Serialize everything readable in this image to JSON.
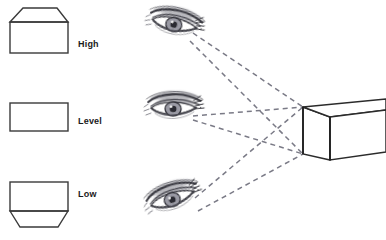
{
  "figure": {
    "background_color": "#ffffff",
    "width": 386,
    "height": 240
  },
  "labels": [
    {
      "id": "high",
      "text": "High",
      "x": 78,
      "y": 40
    },
    {
      "id": "level",
      "text": "Level",
      "x": 78,
      "y": 117
    },
    {
      "id": "low",
      "text": "Low",
      "x": 78,
      "y": 190
    }
  ],
  "left_boxes": [
    {
      "id": "box-high",
      "label": "High",
      "description": "Box seen from above: top face visible as a trapezoid above the front face",
      "stroke": "#3a3a3a",
      "front_face": {
        "x": 10,
        "y": 22,
        "width": 58,
        "height": 31
      },
      "top_face_points": "10,22 23,8 57,8 68,22"
    },
    {
      "id": "box-level",
      "label": "Level",
      "description": "Box seen at eye level: only the front face, a plain rectangle, no top or bottom visible",
      "stroke": "#3a3a3a",
      "front_face": {
        "x": 10,
        "y": 103,
        "width": 58,
        "height": 28
      },
      "top_face_points": "",
      "bottom_face_points": ""
    },
    {
      "id": "box-low",
      "label": "Low",
      "description": "Box seen from below: bottom face visible as a trapezoid below the front face",
      "stroke": "#3a3a3a",
      "front_face": {
        "x": 10,
        "y": 182,
        "width": 58,
        "height": 29
      },
      "bottom_face_points": "10,211 20,227 58,227 68,211"
    }
  ],
  "eyes": [
    {
      "id": "eye-high",
      "position": "top",
      "gaze": "downward toward the box",
      "description": "Pencil-sketched eye viewing the box from a high vantage point",
      "center_x": 175,
      "center_y": 28
    },
    {
      "id": "eye-level",
      "position": "middle",
      "gaze": "straight ahead toward the box",
      "description": "Pencil-sketched eye viewing the box at eye level",
      "center_x": 175,
      "center_y": 112
    },
    {
      "id": "eye-low",
      "position": "bottom",
      "gaze": "upward toward the box",
      "description": "Pencil-sketched eye viewing the box from a low vantage point",
      "center_x": 175,
      "center_y": 202
    }
  ],
  "perspective_box": {
    "id": "box-3d",
    "description": "Three-dimensional box drawn in two-point perspective at the right side of the diagram",
    "stroke": "#2b2b2b",
    "front_top_left": {
      "x": 303,
      "y": 107
    },
    "front_bottom_left": {
      "x": 303,
      "y": 154
    },
    "near_corner_top": {
      "x": 330,
      "y": 117
    },
    "near_corner_bottom": {
      "x": 330,
      "y": 160
    },
    "far_right_top": {
      "x": 380,
      "y": 105
    },
    "far_right_bottom": {
      "x": 380,
      "y": 147
    }
  },
  "sight_lines": {
    "description": "Dashed lines running from each eye to the near vertical edge of the perspective box, showing the viewing angles",
    "color": "#7a7a86",
    "style": "dashed",
    "lines": [
      {
        "from": "eye-high",
        "to": "box-top-corner",
        "x1": 192,
        "y1": 35,
        "x2": 303,
        "y2": 107
      },
      {
        "from": "eye-high",
        "to": "box-bottom-corner",
        "x1": 190,
        "y1": 40,
        "x2": 303,
        "y2": 154
      },
      {
        "from": "eye-level",
        "to": "box-top-corner",
        "x1": 192,
        "y1": 115,
        "x2": 303,
        "y2": 107
      },
      {
        "from": "eye-level",
        "to": "box-bottom-corner",
        "x1": 192,
        "y1": 119,
        "x2": 303,
        "y2": 154
      },
      {
        "from": "eye-low",
        "to": "box-top-corner",
        "x1": 194,
        "y1": 200,
        "x2": 303,
        "y2": 107
      },
      {
        "from": "eye-low",
        "to": "box-bottom-corner",
        "x1": 196,
        "y1": 210,
        "x2": 303,
        "y2": 154
      }
    ]
  }
}
